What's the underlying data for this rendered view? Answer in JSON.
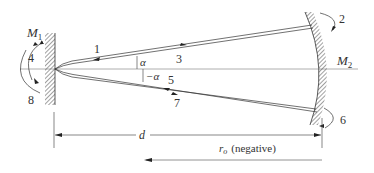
{
  "diagram": {
    "type": "optical resonator ray diagram",
    "mirrors": {
      "left": {
        "label": "M",
        "subscript": "1",
        "shape": "flat"
      },
      "right": {
        "label": "M",
        "subscript": "2",
        "shape": "concave"
      }
    },
    "ray_labels": {
      "r1": "1",
      "r2": "2",
      "r3": "3",
      "r4": "4",
      "r5": "5",
      "r6": "6",
      "r7": "7",
      "r8": "8"
    },
    "angles": {
      "upper": "α",
      "lower": "−α"
    },
    "dimensions": {
      "d_label": "d",
      "r_label": "r",
      "r_subscript": "o",
      "r_note": "(negative)"
    },
    "colors": {
      "line": "#333333",
      "axis": "#999999",
      "hatch": "#444444",
      "background": "#ffffff"
    }
  }
}
